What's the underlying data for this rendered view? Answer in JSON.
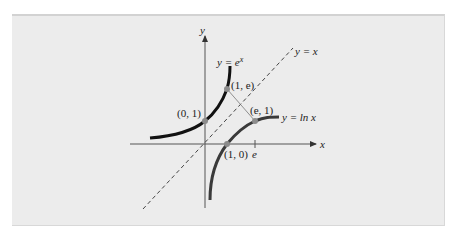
{
  "figure": {
    "axes": {
      "x_label": "x",
      "y_label": "y"
    },
    "curves": [
      {
        "name": "exp",
        "label_prefix": "y = e",
        "label_sup": "x",
        "color": "#111111"
      },
      {
        "name": "ln",
        "label": "y = ln x",
        "color": "#3a3a3a"
      },
      {
        "name": "identity",
        "label": "y = x",
        "style": "dashed",
        "color": "#444444"
      }
    ],
    "points": [
      {
        "label": "(0, 1)",
        "x": 0,
        "y": 1
      },
      {
        "label": "(1, e)",
        "x": 1,
        "y": 2.718
      },
      {
        "label": "(e, 1)",
        "x": 2.718,
        "y": 1
      },
      {
        "label": "(1, 0)",
        "x": 1,
        "y": 0
      }
    ],
    "tick_label_e": "e",
    "colors": {
      "panel_bg": "#ececec",
      "point": "#8c8c8c",
      "axis": "#555555"
    }
  }
}
